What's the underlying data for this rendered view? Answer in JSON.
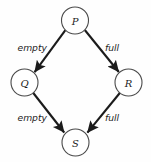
{
  "diagram": {
    "type": "state-transition-graph",
    "shape": "diamond",
    "background_color": "#fefefe",
    "node_stroke_color": "#4a4a4a",
    "edge_color": "#1b1b1b",
    "text_color": "#1b1b1b",
    "nodes": [
      {
        "id": "P",
        "label": "P",
        "cx": 75,
        "cy": 20.5,
        "r": 13.5
      },
      {
        "id": "Q",
        "label": "Q",
        "cx": 24.5,
        "cy": 82.5,
        "r": 13.5
      },
      {
        "id": "R",
        "label": "R",
        "cx": 128.5,
        "cy": 82.5,
        "r": 13.5
      },
      {
        "id": "S",
        "label": "S",
        "cx": 75.5,
        "cy": 142.5,
        "r": 13.5
      }
    ],
    "edges": [
      {
        "id": "p-to-q",
        "from": "P",
        "to": "Q",
        "label": "empty"
      },
      {
        "id": "p-to-r",
        "from": "P",
        "to": "R",
        "label": "full"
      },
      {
        "id": "q-to-s",
        "from": "Q",
        "to": "S",
        "label": "empty"
      },
      {
        "id": "r-to-s",
        "from": "R",
        "to": "S",
        "label": "full"
      }
    ],
    "edge_labels": {
      "p_to_q": "empty",
      "p_to_r": "full",
      "q_to_s": "empty",
      "r_to_s": "full"
    }
  }
}
